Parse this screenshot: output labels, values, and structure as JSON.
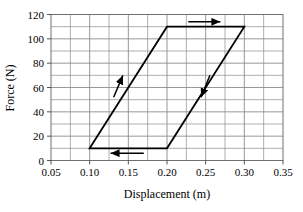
{
  "chart_data": {
    "type": "line",
    "title": "",
    "subtitle": "",
    "xlabel": "Displacement (m)",
    "ylabel": "Force (N)",
    "xlim": [
      0.05,
      0.35
    ],
    "ylim": [
      0,
      120
    ],
    "xticks": [
      0.05,
      0.1,
      0.15,
      0.2,
      0.25,
      0.3,
      0.35
    ],
    "xticklabels": [
      "0.05",
      "0.10",
      "0.15",
      "0.20",
      "0.25",
      "0.30",
      "0.35"
    ],
    "yticks": [
      0,
      20,
      40,
      60,
      80,
      100,
      120
    ],
    "yticklabels": [
      "0",
      "20",
      "40",
      "60",
      "80",
      "100",
      "120"
    ],
    "x_minor_step": 0.025,
    "y_minor_step": 10,
    "grid": true,
    "grid_color": "#8c8c8c",
    "line_color": "#000000",
    "legend": "none",
    "series": [
      {
        "name": "Hysteresis loop",
        "closed": true,
        "points": [
          {
            "x": 0.1,
            "y": 10
          },
          {
            "x": 0.2,
            "y": 110
          },
          {
            "x": 0.3,
            "y": 110
          },
          {
            "x": 0.2,
            "y": 10
          },
          {
            "x": 0.1,
            "y": 10
          }
        ]
      }
    ],
    "annotations": [
      {
        "name": "top-direction-arrow",
        "kind": "arrow",
        "direction": "right",
        "x_start": 0.2275,
        "y_start": 114,
        "x_end": 0.269,
        "y_end": 114
      },
      {
        "name": "bottom-direction-arrow",
        "kind": "arrow",
        "direction": "left",
        "x_start": 0.17,
        "y_start": 6,
        "x_end": 0.127,
        "y_end": 6
      },
      {
        "name": "left-leg-direction-arrow",
        "kind": "arrow",
        "direction": "up-right",
        "x_start": 0.131,
        "y_start": 52,
        "x_end": 0.143,
        "y_end": 70
      },
      {
        "name": "right-leg-direction-arrow",
        "kind": "arrow",
        "direction": "down-left",
        "x_start": 0.2555,
        "y_start": 70,
        "x_end": 0.244,
        "y_end": 52
      }
    ]
  }
}
